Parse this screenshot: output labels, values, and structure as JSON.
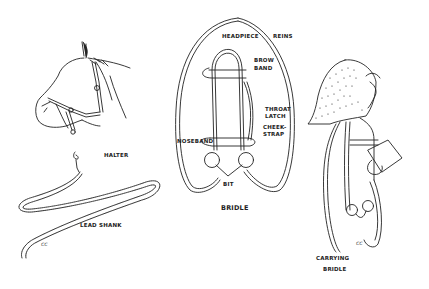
{
  "figures": {
    "halter": {
      "label": "HALTER"
    },
    "lead_shank": {
      "label": "LEAD SHANK",
      "signature": "cc"
    },
    "bridle": {
      "label": "BRIDLE",
      "parts": {
        "headpiece": "HEADPIECE",
        "reins": "REINS",
        "brow_band_1": "BROW",
        "brow_band_2": "BAND",
        "throat_latch_1": "THROAT",
        "throat_latch_2": "LATCH",
        "cheek_strap_1": "CHEEK-",
        "cheek_strap_2": "STRAP",
        "noseband": "NOSEBAND",
        "bit": "BIT"
      }
    },
    "carrying_bridle": {
      "label_1": "CARRYING",
      "label_2": "BRIDLE",
      "signature": "cc"
    }
  },
  "colors": {
    "ink": "#222222",
    "background": "#ffffff"
  }
}
